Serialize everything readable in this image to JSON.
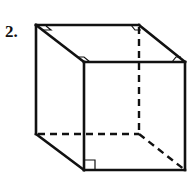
{
  "problem": {
    "number_label": "2."
  },
  "figure": {
    "type": "cube",
    "stroke_color": "#111111",
    "vertices": {
      "back_top_left": [
        36,
        25
      ],
      "back_top_right": [
        139,
        25
      ],
      "front_top_left": [
        84,
        62
      ],
      "front_top_right": [
        185,
        62
      ],
      "back_bottom_left": [
        36,
        134
      ],
      "back_bottom_right": [
        139,
        134
      ],
      "front_bottom_left": [
        84,
        170
      ],
      "front_bottom_right": [
        185,
        170
      ]
    },
    "hidden_edges": [
      "back_top_right-back_bottom_right",
      "back_bottom_left-back_bottom_right",
      "back_bottom_right-front_bottom_right"
    ],
    "right_angle_markers": [
      "back_top_left",
      "back_top_right",
      "front_top_left",
      "front_top_right",
      "front_bottom_left"
    ]
  }
}
